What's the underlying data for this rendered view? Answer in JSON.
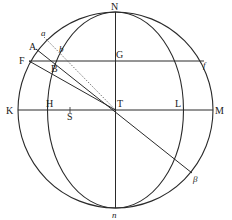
{
  "diagram": {
    "stroke_color": "#2a2a2a",
    "background": "#ffffff",
    "labels": {
      "N": "N",
      "n": "n",
      "K": "K",
      "M": "M",
      "H": "H",
      "S": "S",
      "T": "T",
      "L": "L",
      "G": "G",
      "F": "F",
      "f": "f",
      "A": "A",
      "a": "a",
      "B": "B",
      "b": "b",
      "beta": "β"
    },
    "elements": {
      "outer_circle": "great circle through N, K, n, M",
      "inner_ellipse": "meridian arc through N, H, n, L",
      "horizontal_diameter": "K–T–M",
      "vertical_axis": "N–T–n",
      "parallel_line": "F–B–G–f",
      "line_A_beta": "A–B–T–β",
      "line_F_T": "F–T",
      "dotted_line": "a–b–T"
    }
  }
}
